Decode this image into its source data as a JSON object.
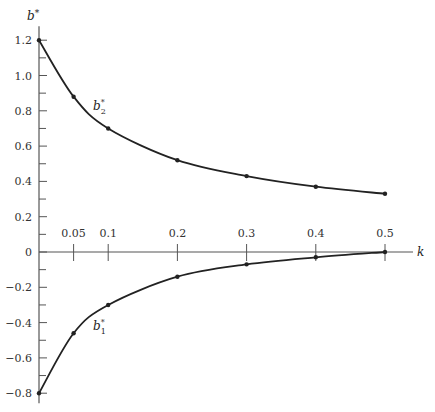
{
  "chart_data": {
    "type": "line",
    "title": "",
    "xlabel": "k",
    "ylabel": "b*",
    "xlim": [
      0,
      0.5
    ],
    "ylim": [
      -0.8,
      1.2
    ],
    "grid": false,
    "x_ticks": [
      0.05,
      0.1,
      0.2,
      0.3,
      0.4,
      0.5
    ],
    "x_tick_labels": [
      "0.05",
      "0.1",
      "0.2",
      "0.3",
      "0.4",
      "0.5"
    ],
    "y_ticks": [
      1.2,
      1.0,
      0.8,
      0.6,
      0.4,
      0.2,
      0,
      -0.2,
      -0.4,
      -0.6,
      -0.8
    ],
    "y_tick_labels": [
      "1.2",
      "1.0",
      "0.8",
      "0.6",
      "0.4",
      "0.2",
      "0",
      "-0.2",
      "-0.4",
      "-0.6",
      "-0.8"
    ],
    "x": [
      0,
      0.05,
      0.1,
      0.2,
      0.3,
      0.4,
      0.5
    ],
    "series": [
      {
        "name": "b2*",
        "label_main": "b",
        "label_sub": "2",
        "label_sup": "*",
        "values": [
          1.2,
          0.88,
          0.7,
          0.52,
          0.43,
          0.37,
          0.33
        ]
      },
      {
        "name": "b1*",
        "label_main": "b",
        "label_sub": "1",
        "label_sup": "*",
        "values": [
          -0.8,
          -0.46,
          -0.3,
          -0.14,
          -0.07,
          -0.03,
          0.0
        ]
      }
    ],
    "annotations": [
      {
        "text": "b2*",
        "near_k": 0.09,
        "near_b": 0.82
      },
      {
        "text": "b1*",
        "near_k": 0.09,
        "near_b": -0.42
      }
    ]
  },
  "axis": {
    "y_title_main": "b",
    "y_title_sup": "*",
    "x_title": "k"
  },
  "colors": {
    "ink": "#222222",
    "background": "#ffffff"
  }
}
